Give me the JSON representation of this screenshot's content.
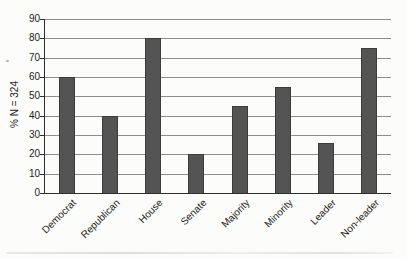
{
  "chart_data": {
    "type": "bar",
    "title": "",
    "xlabel": "",
    "ylabel": "% N = 324",
    "categories": [
      "Democrat",
      "Republican",
      "House",
      "Senate",
      "Majority",
      "Minority",
      "Leader",
      "Non-leader"
    ],
    "values": [
      60,
      40,
      80,
      20,
      45,
      55,
      26,
      75
    ],
    "ylim": [
      0,
      90
    ],
    "yticks": [
      0,
      10,
      20,
      30,
      40,
      50,
      60,
      70,
      80,
      90
    ],
    "grid": true,
    "legend": false,
    "bar_color": "#545454",
    "bar_border_color": "#3c3c3c",
    "gridline_color": "#8e8e8e",
    "axis_color": "#2e2e2e",
    "text_color": "#1c1c1c",
    "background_color": "#fcfcfa"
  }
}
